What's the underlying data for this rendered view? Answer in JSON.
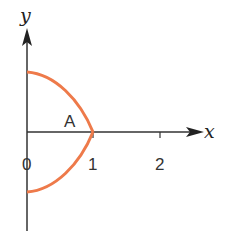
{
  "diagram": {
    "axes": {
      "x_label": "x",
      "y_label": "y",
      "ticks": [
        "0",
        "1",
        "2"
      ]
    },
    "region_label": "A",
    "curve": {
      "description": "Closed curve from (0,1) through (1,0) to (0,-1), symmetric about x-axis, enclosing region A",
      "color": "#ee7a4a"
    },
    "axis_color": "#333333"
  }
}
